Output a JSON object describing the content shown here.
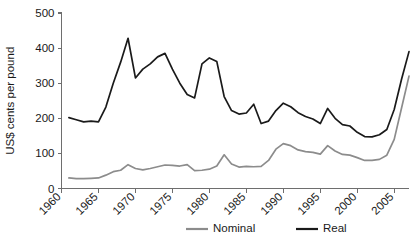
{
  "chart_data": {
    "type": "line",
    "title": "",
    "xlabel": "",
    "ylabel": "US$ cents per pound",
    "xlim": [
      1960,
      2007
    ],
    "ylim": [
      0,
      500
    ],
    "grid": false,
    "legend_position": "bottom-center",
    "xticks": [
      1960,
      1965,
      1970,
      1975,
      1980,
      1985,
      1990,
      1995,
      2000,
      2005
    ],
    "xtick_labels": [
      "1960",
      "1965",
      "1970",
      "1975",
      "1980",
      "1985",
      "1990",
      "1995",
      "2000",
      "2005"
    ],
    "yticks": [
      0,
      100,
      200,
      300,
      400,
      500
    ],
    "ytick_labels": [
      "0",
      "100",
      "200",
      "300",
      "400",
      "500"
    ],
    "x": [
      1961,
      1962,
      1963,
      1964,
      1965,
      1966,
      1967,
      1968,
      1969,
      1970,
      1971,
      1972,
      1973,
      1974,
      1975,
      1976,
      1977,
      1978,
      1979,
      1980,
      1981,
      1982,
      1983,
      1984,
      1985,
      1986,
      1987,
      1988,
      1989,
      1990,
      1991,
      1992,
      1993,
      1994,
      1995,
      1996,
      1997,
      1998,
      1999,
      2000,
      2001,
      2002,
      2003,
      2004,
      2005,
      2006,
      2007
    ],
    "series": [
      {
        "name": "Nominal",
        "color": "#8c8c8c",
        "values": [
          30,
          28,
          28,
          29,
          30,
          38,
          48,
          52,
          68,
          57,
          53,
          57,
          62,
          67,
          66,
          64,
          68,
          51,
          52,
          55,
          64,
          96,
          70,
          61,
          63,
          62,
          63,
          80,
          112,
          128,
          122,
          110,
          105,
          103,
          98,
          122,
          107,
          97,
          95,
          88,
          80,
          80,
          83,
          95,
          140,
          230,
          320
        ]
      },
      {
        "name": "Real",
        "color": "#1a1a1a",
        "values": [
          202,
          196,
          190,
          192,
          190,
          232,
          300,
          360,
          428,
          315,
          340,
          355,
          375,
          385,
          340,
          300,
          268,
          258,
          355,
          372,
          362,
          262,
          222,
          212,
          215,
          240,
          185,
          192,
          222,
          243,
          233,
          216,
          205,
          198,
          185,
          228,
          200,
          182,
          178,
          160,
          148,
          147,
          153,
          168,
          225,
          312,
          390
        ]
      }
    ],
    "legend": [
      {
        "label": "Nominal",
        "color": "#8c8c8c"
      },
      {
        "label": "Real",
        "color": "#1a1a1a"
      }
    ]
  }
}
